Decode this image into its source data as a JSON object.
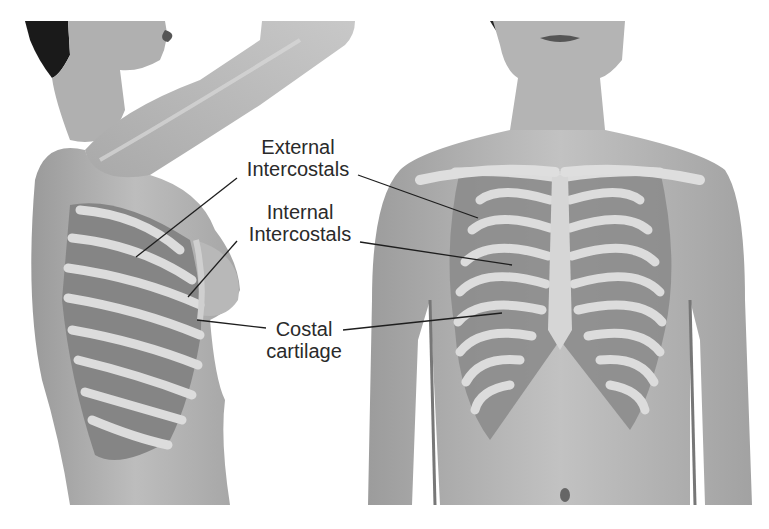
{
  "diagram": {
    "views": [
      {
        "name": "lateral view",
        "description": "Side view of female torso with raised arm showing ribs"
      },
      {
        "name": "anterior view",
        "description": "Front view of female torso showing rib cage"
      }
    ],
    "labels": [
      {
        "id": "external-intercostals",
        "lines": [
          "External",
          "Intercostals"
        ]
      },
      {
        "id": "internal-intercostals",
        "lines": [
          "Internal",
          "Intercostals"
        ]
      },
      {
        "id": "costal-cartilage",
        "lines": [
          "Costal",
          "cartilage"
        ]
      }
    ],
    "colors": {
      "background": "#ffffff",
      "skin": "#b4b4b4",
      "skin_dark": "#8a8a8a",
      "rib": "#dcdcdc",
      "muscle": "#7c7c7c",
      "hair": "#1a1a1a",
      "text": "#2a2a2a",
      "leader": "#1e1e1e"
    }
  }
}
